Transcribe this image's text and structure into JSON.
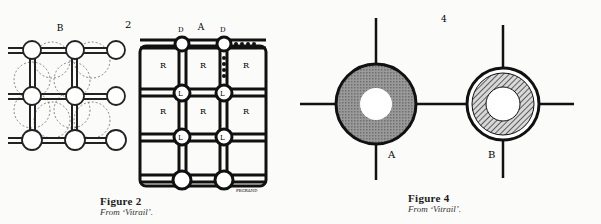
{
  "figure2": {
    "caption_title": "Figure 2",
    "caption_source": "From ‘Vitrail’.",
    "number_label": "2",
    "panel_b_label": "B",
    "panel_a_label": "A",
    "panel_b_cells": [
      "ℓ",
      "ℓ",
      "ℓ",
      "ℓ",
      "r",
      "r"
    ],
    "panel_a_top_labels": [
      "D",
      "D",
      "e",
      "e",
      "f",
      "f"
    ],
    "panel_a_cells": [
      "R",
      "R",
      "R",
      "R",
      "R",
      "R",
      "L",
      "L",
      "L",
      "L",
      "C",
      "C",
      "C",
      "C",
      "C",
      "C"
    ],
    "signature": "PEGRAND"
  },
  "figure4": {
    "caption_title": "Figure 4",
    "caption_source": "From ‘Vitrail’.",
    "number_label": "4",
    "node_a_label": "A",
    "node_b_label": "B"
  }
}
